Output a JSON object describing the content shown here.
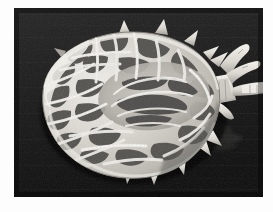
{
  "page": {
    "background_color": "#fdfdfd",
    "width": 273,
    "height": 212
  },
  "photograph": {
    "kind": "grayscale-scanned-photograph",
    "subject": "tick-specimen-dorsal-view",
    "caption": "",
    "plate": {
      "x": 14,
      "y": 8,
      "width": 249,
      "height": 189,
      "background_color": "#1c1c1c",
      "background_color_dark": "#0d0d0d",
      "background_color_light": "#2b2b2b",
      "border_color": "#3a3a3a"
    },
    "specimen": {
      "body_fill_light": "#e9e7e2",
      "body_fill_mid": "#c6c3bc",
      "body_shadow": "#6e6b66",
      "pattern_dark": "#4a4845",
      "pattern_mid": "#6b6864",
      "ridge_highlight": "#f4f2ed",
      "outline_color": "#8a8780",
      "center_x": 124,
      "center_y": 97,
      "body_rx": 92,
      "body_ry": 70,
      "capitulum_label": "capitulum",
      "palp_label": "palps",
      "festoon_label": "marginal-spines"
    }
  }
}
